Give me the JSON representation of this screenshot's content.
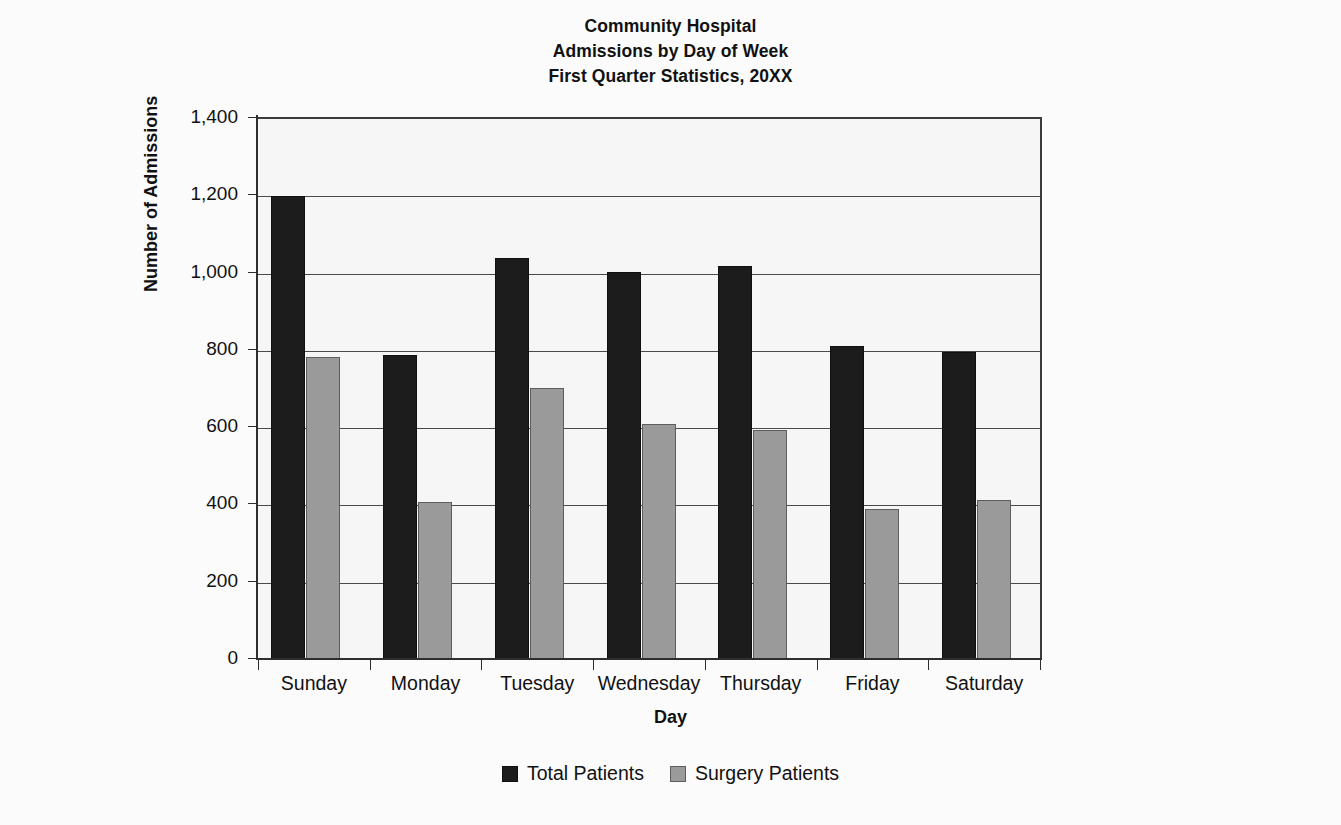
{
  "chart_data": {
    "type": "bar",
    "title": "Community Hospital Admissions by Day of Week First Quarter Statistics, 20XX",
    "title_lines": [
      "Community Hospital",
      "Admissions by Day of Week",
      "First Quarter Statistics, 20XX"
    ],
    "xlabel": "Day",
    "ylabel": "Number of Admissions",
    "categories": [
      "Sunday",
      "Monday",
      "Tuesday",
      "Wednesday",
      "Thursday",
      "Friday",
      "Saturday"
    ],
    "series": [
      {
        "name": "Total Patients",
        "color": "#1c1c1c",
        "values": [
          1200,
          790,
          1040,
          1005,
          1020,
          812,
          798
        ]
      },
      {
        "name": "Surgery Patients",
        "color": "#9a9a9a",
        "values": [
          785,
          410,
          705,
          612,
          595,
          392,
          415
        ]
      }
    ],
    "ylim": [
      0,
      1400
    ],
    "ytick_step": 200,
    "yticks": [
      0,
      200,
      400,
      600,
      800,
      1000,
      1200,
      1400
    ],
    "ytick_labels": [
      "0",
      "200",
      "400",
      "600",
      "800",
      "1,000",
      "1,200",
      "1,400"
    ],
    "grid": true,
    "grid_axis": "y",
    "legend_position": "bottom"
  },
  "colors": {
    "background": "#fbfbfb",
    "plot_background": "#f6f6f6",
    "axis": "#2e2e2e",
    "gridline": "#4a4a4a",
    "total_patients": "#1c1c1c",
    "surgery_patients": "#9a9a9a"
  }
}
